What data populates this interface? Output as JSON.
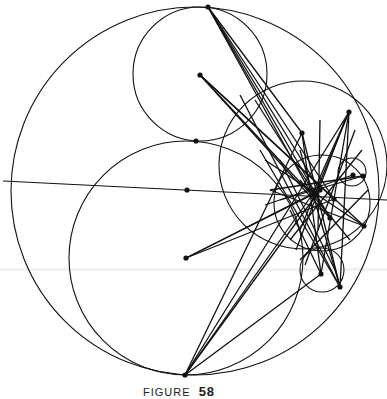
{
  "figure": {
    "caption_prefix": "FIGURE",
    "caption_number": "58",
    "stroke_color": "#111111",
    "background": "#ffffff",
    "circles": [
      {
        "name": "outer-circle",
        "cx": 195,
        "cy": 191,
        "r": 184
      },
      {
        "name": "upper-inner-circle",
        "cx": 200,
        "cy": 74,
        "r": 67
      },
      {
        "name": "lower-inner-circle",
        "cx": 186,
        "cy": 258,
        "r": 117
      },
      {
        "name": "right-medium-circle",
        "cx": 303,
        "cy": 165,
        "r": 84
      },
      {
        "name": "right-small-circle-lower",
        "cx": 322,
        "cy": 203,
        "r": 48
      },
      {
        "name": "right-tiny-circle-top",
        "cx": 352,
        "cy": 172,
        "r": 14
      },
      {
        "name": "right-tiny-circle-bottom",
        "cx": 322,
        "cy": 270,
        "r": 22
      }
    ],
    "line": {
      "name": "axis-line",
      "x1": 3,
      "y1": 181,
      "x2": 387,
      "y2": 200
    },
    "points": [
      {
        "name": "top-point",
        "x": 208,
        "y": 7
      },
      {
        "name": "upper-center-point",
        "x": 200,
        "y": 75
      },
      {
        "name": "tangent-point",
        "x": 196,
        "y": 141
      },
      {
        "name": "center-point",
        "x": 187,
        "y": 190
      },
      {
        "name": "lower-center-point",
        "x": 186,
        "y": 258
      },
      {
        "name": "bottom-point",
        "x": 185,
        "y": 375
      },
      {
        "name": "right-point-a",
        "x": 349,
        "y": 112
      },
      {
        "name": "right-point-b",
        "x": 302,
        "y": 133
      },
      {
        "name": "right-point-c",
        "x": 353,
        "y": 175
      },
      {
        "name": "right-point-d",
        "x": 363,
        "y": 176
      },
      {
        "name": "hub-point",
        "x": 312,
        "y": 195
      },
      {
        "name": "hub-point-2",
        "x": 320,
        "y": 190
      },
      {
        "name": "right-point-e",
        "x": 334,
        "y": 199
      },
      {
        "name": "right-point-f",
        "x": 330,
        "y": 218
      },
      {
        "name": "right-point-g",
        "x": 364,
        "y": 226
      },
      {
        "name": "right-point-h",
        "x": 321,
        "y": 274
      },
      {
        "name": "right-point-i",
        "x": 340,
        "y": 287
      }
    ],
    "segments": [
      [
        208,
        7,
        312,
        195
      ],
      [
        208,
        7,
        330,
        218
      ],
      [
        208,
        7,
        334,
        199
      ],
      [
        208,
        7,
        320,
        190
      ],
      [
        208,
        7,
        302,
        133
      ],
      [
        200,
        75,
        312,
        195
      ],
      [
        200,
        75,
        334,
        199
      ],
      [
        200,
        75,
        330,
        218
      ],
      [
        200,
        75,
        364,
        226
      ],
      [
        186,
        258,
        312,
        195
      ],
      [
        186,
        258,
        320,
        190
      ],
      [
        186,
        258,
        334,
        199
      ],
      [
        185,
        375,
        312,
        195
      ],
      [
        185,
        375,
        321,
        274
      ],
      [
        185,
        375,
        302,
        133
      ],
      [
        185,
        375,
        349,
        112
      ],
      [
        185,
        375,
        320,
        190
      ],
      [
        349,
        112,
        312,
        195
      ],
      [
        349,
        112,
        321,
        274
      ],
      [
        349,
        112,
        340,
        287
      ],
      [
        349,
        112,
        300,
        230
      ],
      [
        302,
        133,
        321,
        274
      ],
      [
        302,
        133,
        340,
        287
      ],
      [
        363,
        176,
        270,
        190
      ],
      [
        363,
        176,
        280,
        200
      ],
      [
        353,
        175,
        265,
        205
      ],
      [
        270,
        190,
        364,
        226
      ],
      [
        265,
        160,
        364,
        226
      ],
      [
        260,
        150,
        340,
        287
      ],
      [
        290,
        210,
        321,
        274
      ],
      [
        280,
        160,
        335,
        270
      ],
      [
        300,
        150,
        340,
        287
      ],
      [
        345,
        120,
        296,
        250
      ],
      [
        355,
        130,
        305,
        265
      ],
      [
        320,
        120,
        318,
        230
      ],
      [
        240,
        95,
        340,
        287
      ],
      [
        255,
        100,
        330,
        218
      ],
      [
        362,
        150,
        290,
        240
      ],
      [
        368,
        190,
        300,
        260
      ],
      [
        350,
        240,
        300,
        180
      ]
    ]
  }
}
